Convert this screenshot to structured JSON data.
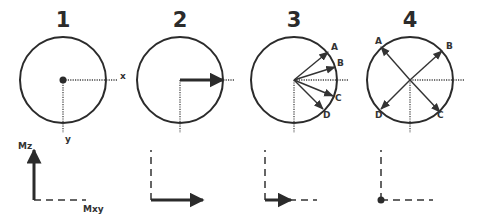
{
  "panels": [
    {
      "number": "1",
      "axis_x": "x",
      "axis_y": "y",
      "vectors": []
    },
    {
      "number": "2",
      "vectors": []
    },
    {
      "number": "3",
      "vectors": [
        "A",
        "B",
        "C",
        "D"
      ]
    },
    {
      "number": "4",
      "vectors": [
        "A",
        "B",
        "C",
        "D"
      ]
    }
  ],
  "bottom_axes": {
    "vertical": "Mz",
    "horizontal": "Mxy"
  },
  "stages": [
    {
      "stage": 1,
      "mz": 1.0,
      "mxy": 0.0
    },
    {
      "stage": 2,
      "mz": 0.0,
      "mxy": 1.0
    },
    {
      "stage": 3,
      "mz": 0.0,
      "mxy": 0.5
    },
    {
      "stage": 4,
      "mz": 0.0,
      "mxy": 0.0
    }
  ]
}
